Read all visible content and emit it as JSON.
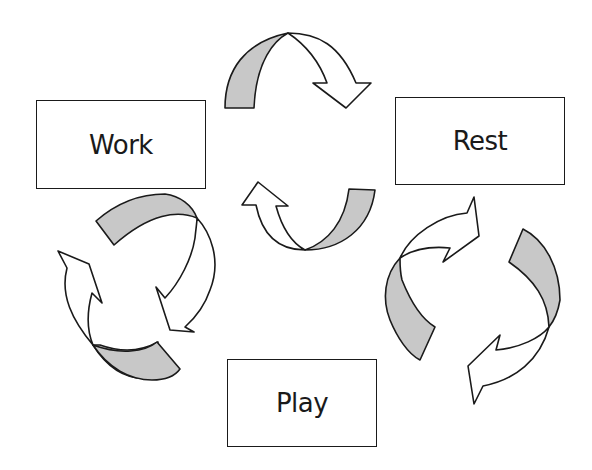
{
  "diagram": {
    "type": "cycle",
    "nodes": [
      {
        "id": "work",
        "label": "Work"
      },
      {
        "id": "rest",
        "label": "Rest"
      },
      {
        "id": "play",
        "label": "Play"
      }
    ],
    "edges": [
      {
        "from": "work",
        "to": "rest",
        "style": "bidirectional-curved-arrows"
      },
      {
        "from": "rest",
        "to": "play",
        "style": "bidirectional-curved-arrows"
      },
      {
        "from": "play",
        "to": "work",
        "style": "bidirectional-curved-arrows"
      }
    ],
    "colors": {
      "stroke": "#1a1a1a",
      "arrow_fill": "#ffffff",
      "arrow_shade": "#c8c8c8",
      "background": "#ffffff"
    }
  }
}
